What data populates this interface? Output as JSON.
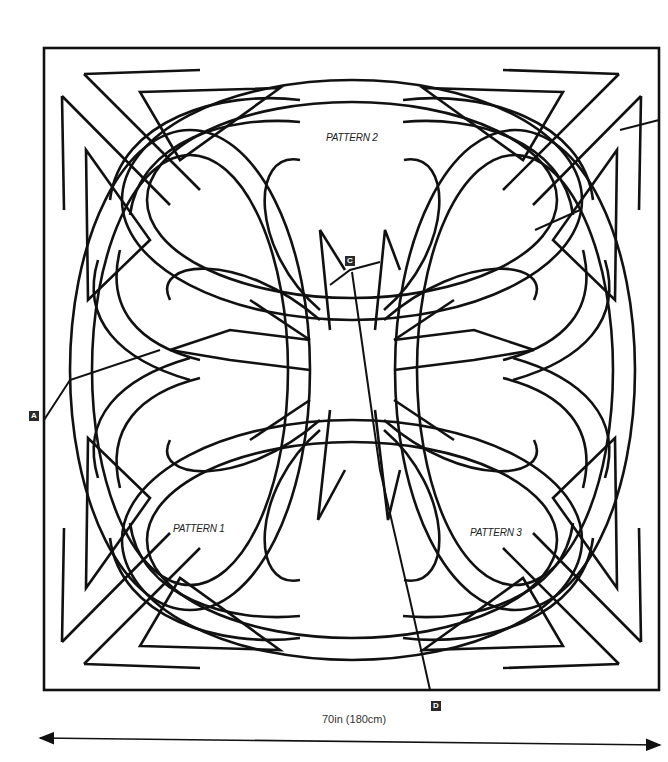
{
  "diagram": {
    "patterns": [
      {
        "label": "PATTERN 1",
        "x": 173,
        "y": 523
      },
      {
        "label": "PATTERN 2",
        "x": 326,
        "y": 132
      },
      {
        "label": "PATTERN 3",
        "x": 470,
        "y": 527
      }
    ],
    "markers": [
      {
        "label": "A",
        "x": 29,
        "y": 411
      },
      {
        "label": "C",
        "x": 345,
        "y": 256
      },
      {
        "label": "D",
        "x": 431,
        "y": 701
      }
    ],
    "dimension": {
      "label": "70in (180cm)",
      "arrow_start_x": 40,
      "arrow_end_x": 660,
      "arrow_y": 740
    },
    "colors": {
      "line": "#111111",
      "background": "#ffffff",
      "marker_fill": "#2a2a2a"
    }
  }
}
